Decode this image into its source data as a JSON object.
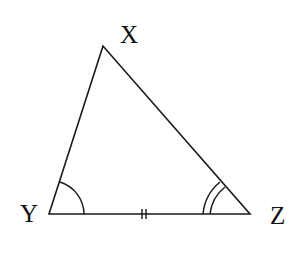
{
  "diagram": {
    "type": "triangle",
    "vertices": {
      "X": {
        "label": "X",
        "x": 103,
        "y": 46
      },
      "Y": {
        "label": "Y",
        "x": 49,
        "y": 214
      },
      "Z": {
        "label": "Z",
        "x": 250,
        "y": 214
      }
    },
    "markings": {
      "angle_Y": "single arc",
      "angle_Z": "double arc",
      "side_YZ": "double tick"
    },
    "stroke_color": "#1a1a1a"
  }
}
